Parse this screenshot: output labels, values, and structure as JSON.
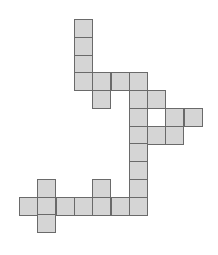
{
  "diagram": {
    "type": "polyomino-net",
    "origin": {
      "x": 19,
      "y": 19
    },
    "cell_width": 18.3,
    "cell_height": 17.75,
    "fill_color": "#d5d5d5",
    "border_color": "#6a6a6a",
    "cells": [
      [
        3,
        0
      ],
      [
        3,
        1
      ],
      [
        3,
        2
      ],
      [
        3,
        3
      ],
      [
        4,
        3
      ],
      [
        5,
        3
      ],
      [
        6,
        3
      ],
      [
        4,
        4
      ],
      [
        6,
        4
      ],
      [
        7,
        4
      ],
      [
        6,
        5
      ],
      [
        8,
        5
      ],
      [
        9,
        5
      ],
      [
        6,
        6
      ],
      [
        7,
        6
      ],
      [
        8,
        6
      ],
      [
        6,
        7
      ],
      [
        6,
        8
      ],
      [
        1,
        9
      ],
      [
        4,
        9
      ],
      [
        6,
        9
      ],
      [
        0,
        10
      ],
      [
        1,
        10
      ],
      [
        2,
        10
      ],
      [
        3,
        10
      ],
      [
        4,
        10
      ],
      [
        5,
        10
      ],
      [
        6,
        10
      ],
      [
        1,
        11
      ]
    ]
  }
}
